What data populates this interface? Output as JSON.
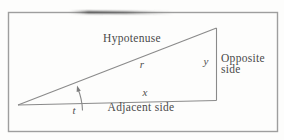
{
  "figure": {
    "labels": {
      "hypotenuse": "Hypotenuse",
      "hypotenuse_var": "r",
      "opposite_var": "y",
      "opposite_line1": "Opposite",
      "opposite_line2": "side",
      "adjacent_var": "x",
      "adjacent": "Adjacent side",
      "angle_var": "t"
    },
    "colors": {
      "background": "#fdfdfc",
      "border": "#9e9e9e",
      "line": "#8a8a8a",
      "text": "#4a4a4a",
      "scan_smudge": "#3f3f3f"
    }
  }
}
